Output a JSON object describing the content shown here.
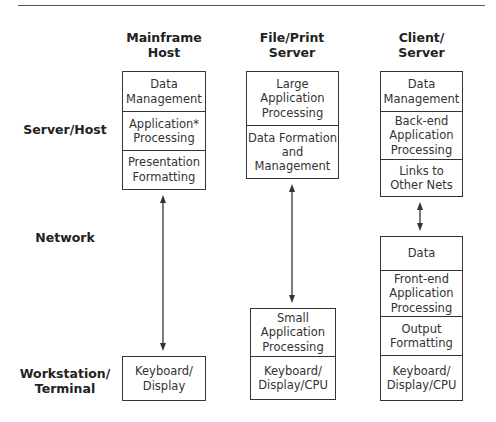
{
  "columns": [
    {
      "id": "mainframe",
      "title": "Mainframe\nHost"
    },
    {
      "id": "fileprint",
      "title": "File/Print\nServer"
    },
    {
      "id": "clientserver",
      "title": "Client/\nServer"
    }
  ],
  "rows": [
    {
      "id": "server",
      "label": "Server/Host"
    },
    {
      "id": "network",
      "label": "Network"
    },
    {
      "id": "workstation",
      "label": "Workstation/\nTerminal"
    }
  ],
  "stacks": {
    "mainframe_server": [
      "Data\nManagement",
      "Application*\nProcessing",
      "Presentation\nFormatting"
    ],
    "mainframe_workstation": [
      "Keyboard/\nDisplay"
    ],
    "fileprint_server": [
      "Large\nApplication\nProcessing",
      "Data Formation\nand\nManagement"
    ],
    "fileprint_workstation": [
      "Small\nApplication\nProcessing",
      "Keyboard/\nDisplay/CPU"
    ],
    "clientserver_server": [
      "Data\nManagement",
      "Back-end\nApplication\nProcessing",
      "Links to\nOther Nets"
    ],
    "clientserver_workstation": [
      "Data",
      "Front-end\nApplication\nProcessing",
      "Output\nFormatting",
      "Keyboard/\nDisplay/CPU"
    ]
  },
  "connectors": [
    {
      "from": "mainframe_server",
      "to": "mainframe_workstation",
      "type": "double-arrow"
    },
    {
      "from": "fileprint_server",
      "to": "fileprint_workstation",
      "type": "double-arrow"
    },
    {
      "from": "clientserver_server",
      "to": "clientserver_workstation",
      "type": "double-arrow"
    }
  ],
  "colors": {
    "line": "#333333",
    "text": "#222222",
    "background": "#ffffff"
  }
}
